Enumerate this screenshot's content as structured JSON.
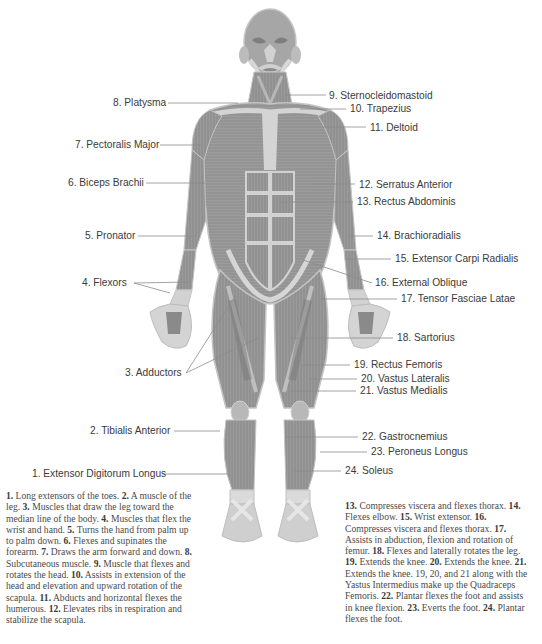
{
  "diagram": {
    "title": "",
    "labels_left": [
      {
        "num": "8",
        "name": "Platysma",
        "text": "8. Platysma",
        "x": 137,
        "y": 97
      },
      {
        "num": "7",
        "name": "Pectoralis Major",
        "text": "7. Pectoralis Major",
        "x": 75,
        "y": 139
      },
      {
        "num": "6",
        "name": "Biceps Brachii",
        "text": "6. Biceps Brachii",
        "x": 68,
        "y": 177
      },
      {
        "num": "5",
        "name": "Pronator",
        "text": "5. Pronator",
        "x": 85,
        "y": 230
      },
      {
        "num": "4",
        "name": "Flexors",
        "text": "4. Flexors",
        "x": 82,
        "y": 277
      },
      {
        "num": "3",
        "name": "Adductors",
        "text": "3. Adductors",
        "x": 125,
        "y": 367
      },
      {
        "num": "2",
        "name": "Tibialis Anterior",
        "text": "2. Tibialis Anterior",
        "x": 90,
        "y": 425
      },
      {
        "num": "1",
        "name": "Extensor Digitorum Longus",
        "text": "1. Extensor Digitorum Longus",
        "x": 32,
        "y": 468
      }
    ],
    "labels_right": [
      {
        "num": "9",
        "name": "Sternocleidomastoid",
        "text": "9. Sternocleidomastoid",
        "x": 329,
        "y": 90
      },
      {
        "num": "10",
        "name": "Trapezius",
        "text": "10. Trapezius",
        "x": 350,
        "y": 103
      },
      {
        "num": "11",
        "name": "Deltoid",
        "text": "11. Deltoid",
        "x": 370,
        "y": 122
      },
      {
        "num": "12",
        "name": "Serratus Anterior",
        "text": "12. Serratus Anterior",
        "x": 359,
        "y": 179
      },
      {
        "num": "13",
        "name": "Rectus Abdominis",
        "text": "13. Rectus Abdominis",
        "x": 357,
        "y": 196
      },
      {
        "num": "14",
        "name": "Brachioradialis",
        "text": "14. Brachioradialis",
        "x": 377,
        "y": 230
      },
      {
        "num": "15",
        "name": "Extensor Carpi Radialis",
        "text": "15. Extensor Carpi Radialis",
        "x": 395,
        "y": 254
      },
      {
        "num": "16",
        "name": "External Oblique",
        "text": "16. External Oblique",
        "x": 375,
        "y": 277
      },
      {
        "num": "17",
        "name": "Tensor Fasciae Latae",
        "text": "17. Tensor Fasciae Latae",
        "x": 401,
        "y": 293
      },
      {
        "num": "18",
        "name": "Sartorius",
        "text": "18. Sartorius",
        "x": 397,
        "y": 332
      },
      {
        "num": "19",
        "name": "Rectus Femoris",
        "text": "19. Rectus Femoris",
        "x": 354,
        "y": 359
      },
      {
        "num": "20",
        "name": "Vastus Lateralis",
        "text": "20. Vastus Lateralis",
        "x": 361,
        "y": 373
      },
      {
        "num": "21",
        "name": "Vastus Medialis",
        "text": "21. Vastus Medialis",
        "x": 360,
        "y": 385
      },
      {
        "num": "22",
        "name": "Gastrocnemius",
        "text": "22. Gastrocnemius",
        "x": 362,
        "y": 431
      },
      {
        "num": "23",
        "name": "Peroneus Longus",
        "text": "23. Peroneus Longus",
        "x": 371,
        "y": 446
      },
      {
        "num": "24",
        "name": "Soleus",
        "text": "24.  Soleus",
        "x": 345,
        "y": 465
      }
    ],
    "descriptions_left": [
      {
        "n": "1.",
        "t": " Long extensors of the toes. "
      },
      {
        "n": "2.",
        "t": " A muscle of the leg. "
      },
      {
        "n": "3.",
        "t": " Muscles that draw the leg toward the median line of the body. "
      },
      {
        "n": "4.",
        "t": " Muscles that flex the wrist and hand. "
      },
      {
        "n": "5.",
        "t": " Turns the hand from palm up to palm down. "
      },
      {
        "n": "6.",
        "t": " Flexes and supinates the forearm. "
      },
      {
        "n": "7.",
        "t": " Draws the arm forward and down. "
      },
      {
        "n": "8.",
        "t": " Subcutaneous muscle. "
      },
      {
        "n": "9.",
        "t": " Muscle that flexes and rotates the head. "
      },
      {
        "n": "10.",
        "t": " Assists in extension of the head and elevation and upward rotation of the scapula. "
      },
      {
        "n": "11.",
        "t": " Abducts and horizontal flexes the humerous. "
      },
      {
        "n": "12.",
        "t": " Elevates ribs in respiration and stabilize the scapula."
      }
    ],
    "descriptions_right": [
      {
        "n": "13.",
        "t": " Compresses viscera and flexes thorax. "
      },
      {
        "n": "14.",
        "t": " Flexes elbow. "
      },
      {
        "n": "15.",
        "t": " Wrist extensor. "
      },
      {
        "n": "16.",
        "t": " Compresses viscera and flexes thorax. "
      },
      {
        "n": "17.",
        "t": " Assists in abduction, flexion and rotation of femur. "
      },
      {
        "n": "18.",
        "t": " Flexes and laterally rotates the leg. "
      },
      {
        "n": "19.",
        "t": " Extends the knee. "
      },
      {
        "n": "20.",
        "t": " Extends the knee. "
      },
      {
        "n": "21.",
        "t": " Extends the knee. 19, 20, and 21 along with the Yastus Intermedius make up the Quadraceps Femoris. "
      },
      {
        "n": "22.",
        "t": " Plantar flexes the foot and assists in knee flexion. "
      },
      {
        "n": "23.",
        "t": " Everts the foot. "
      },
      {
        "n": "24.",
        "t": " Plantar flexes the foot."
      }
    ],
    "colors": {
      "muscle_dark": "#8a8a8a",
      "muscle_mid": "#a3a3a3",
      "tendon_light": "#d6d6d6",
      "outline": "#bdbdbd",
      "label_text": "#3a3a3a",
      "leader_line": "#8c8c8c",
      "desc_text": "#4a4a4a"
    }
  }
}
